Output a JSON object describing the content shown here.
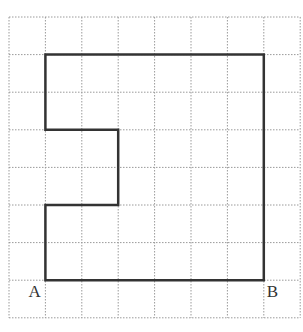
{
  "diagram": {
    "grid": {
      "columns": 8,
      "rows": 8,
      "origin_x": 9,
      "origin_y": 17,
      "cell_w": 36.4,
      "cell_h": 37.6,
      "line_color": "#9a9a9a",
      "style": "dotted"
    },
    "shape": {
      "stroke_color": "#333333",
      "stroke_width": 2.5,
      "vertices_grid": [
        [
          1,
          1
        ],
        [
          7,
          1
        ],
        [
          7,
          7
        ],
        [
          1,
          7
        ],
        [
          1,
          5
        ],
        [
          3,
          5
        ],
        [
          3,
          3
        ],
        [
          1,
          3
        ]
      ]
    },
    "labels": [
      {
        "text": "A",
        "grid_point": [
          1,
          7
        ],
        "anchor": "below-left"
      },
      {
        "text": "B",
        "grid_point": [
          7,
          7
        ],
        "anchor": "below-right"
      }
    ]
  }
}
